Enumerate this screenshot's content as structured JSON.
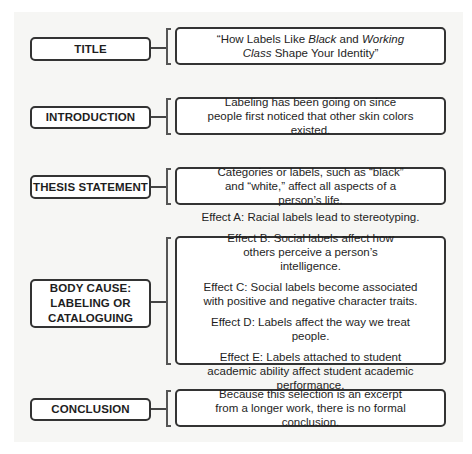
{
  "diagram": {
    "rows": [
      {
        "id": "title",
        "label": "TITLE",
        "content": {
          "parts": [
            {
              "text": "“How Labels Like ",
              "italic": false
            },
            {
              "text": "Black",
              "italic": true
            },
            {
              "text": " and ",
              "italic": false
            },
            {
              "text": "Working Class",
              "italic": true
            },
            {
              "text": " Shape Your Identity”",
              "italic": false
            }
          ]
        }
      },
      {
        "id": "introduction",
        "label": "INTRODUCTION",
        "content": "Labeling has been going on since people first noticed that other skin colors existed."
      },
      {
        "id": "thesis-statement",
        "label": "THESIS STATEMENT",
        "content": "Categories or labels, such as “black” and “white,” affect all aspects of a person’s life."
      },
      {
        "id": "body-cause",
        "label": "BODY CAUSE: LABELING OR CATALOGUING",
        "effects": [
          "Effect A: Racial labels lead to stereotyping.",
          "Effect B: Social labels affect how others perceive a person’s intelligence.",
          "Effect C: Social labels become associated with positive and negative character traits.",
          "Effect D: Labels affect the way we treat people.",
          "Effect E: Labels attached to student academic ability affect student academic performance."
        ]
      },
      {
        "id": "conclusion",
        "label": "CONCLUSION",
        "content": "Because this selection is an excerpt from a longer work, there is no formal conclusion."
      }
    ],
    "title_text": {
      "part1": "“How Labels Like ",
      "part2": "Black",
      "part3": " and ",
      "part4": "Working",
      "part5": "Class",
      "part6": " Shape Your Identity”"
    }
  },
  "colors": {
    "background": "#ffffff",
    "panel": "#f6f6f4",
    "border": "#333333",
    "text": "#1e1e1e"
  }
}
